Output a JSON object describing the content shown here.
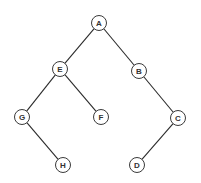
{
  "diagram": {
    "type": "binary-tree",
    "root": "A",
    "nodes": [
      {
        "id": "A",
        "label": "A",
        "x": 99,
        "y": 23
      },
      {
        "id": "E",
        "label": "E",
        "x": 60,
        "y": 69
      },
      {
        "id": "B",
        "label": "B",
        "x": 139,
        "y": 71
      },
      {
        "id": "G",
        "label": "G",
        "x": 22,
        "y": 117
      },
      {
        "id": "F",
        "label": "F",
        "x": 101,
        "y": 117
      },
      {
        "id": "C",
        "label": "C",
        "x": 178,
        "y": 118
      },
      {
        "id": "H",
        "label": "H",
        "x": 63,
        "y": 165
      },
      {
        "id": "D",
        "label": "D",
        "x": 137,
        "y": 165
      }
    ],
    "edges": [
      {
        "from": "A",
        "to": "E"
      },
      {
        "from": "A",
        "to": "B"
      },
      {
        "from": "E",
        "to": "G"
      },
      {
        "from": "E",
        "to": "F"
      },
      {
        "from": "B",
        "to": "C"
      },
      {
        "from": "G",
        "to": "H"
      },
      {
        "from": "C",
        "to": "D"
      }
    ],
    "node_radius": 7.5
  }
}
